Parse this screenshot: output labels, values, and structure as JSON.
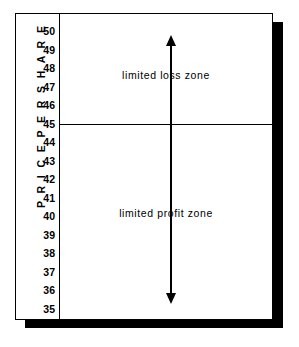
{
  "chart_data": {
    "type": "bar",
    "title": "",
    "xlabel": "",
    "ylabel": "P R I C E   P E R   S H A R E",
    "ylim": [
      35,
      50
    ],
    "grid": false,
    "legend": "none",
    "categories": [],
    "values": [],
    "ytick_labels": [
      "50",
      "49",
      "48",
      "47",
      "46",
      "45",
      "44",
      "43",
      "42",
      "41",
      "40",
      "39",
      "38",
      "37",
      "36",
      "35"
    ],
    "ytick_values": [
      50,
      49,
      48,
      47,
      46,
      45,
      44,
      43,
      42,
      41,
      40,
      39,
      38,
      37,
      36,
      35
    ],
    "strike_price": 45,
    "annotations": [
      {
        "name": "limited-loss-zone",
        "text": "limited loss zone",
        "range": [
          45,
          50
        ],
        "arrow": "up",
        "arrow_from": 45,
        "arrow_to": 50
      },
      {
        "name": "limited-profit-zone",
        "text": "limited profit zone",
        "range": [
          35,
          45
        ],
        "arrow": "down",
        "arrow_from": 45,
        "arrow_to": 35
      }
    ],
    "colors": {
      "ink": "#000000",
      "background": "#ffffff",
      "shadow": "#000000"
    }
  },
  "axis": {
    "title": "P R I C E   P E R   S H A R E",
    "ticks": [
      {
        "label": "50",
        "value": 50
      },
      {
        "label": "49",
        "value": 49
      },
      {
        "label": "48",
        "value": 48
      },
      {
        "label": "47",
        "value": 47
      },
      {
        "label": "46",
        "value": 46
      },
      {
        "label": "45",
        "value": 45
      },
      {
        "label": "44",
        "value": 44
      },
      {
        "label": "43",
        "value": 43
      },
      {
        "label": "42",
        "value": 42
      },
      {
        "label": "41",
        "value": 41
      },
      {
        "label": "40",
        "value": 40
      },
      {
        "label": "39",
        "value": 39
      },
      {
        "label": "38",
        "value": 38
      },
      {
        "label": "37",
        "value": 37
      },
      {
        "label": "36",
        "value": 36
      },
      {
        "label": "35",
        "value": 35
      }
    ]
  },
  "zones": {
    "loss": {
      "label": "limited loss zone"
    },
    "profit": {
      "label": "limited profit zone"
    }
  }
}
